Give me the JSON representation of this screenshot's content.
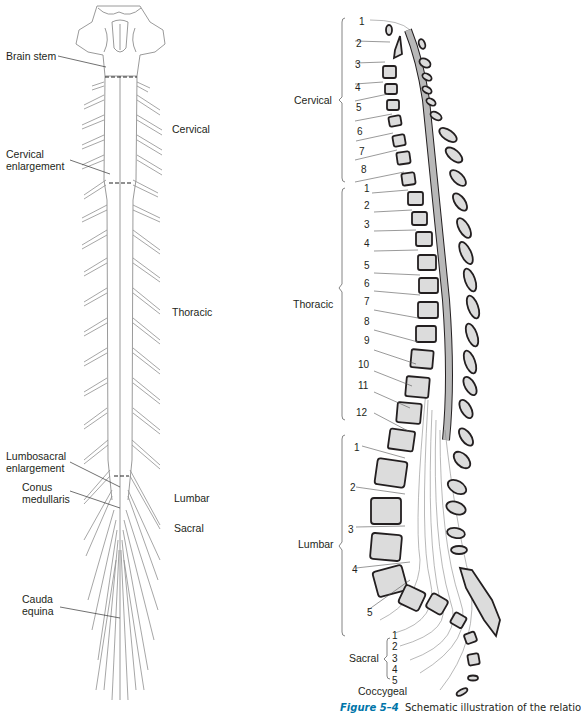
{
  "left_diagram": {
    "title": "Spinal cord (posterior view)",
    "labels": {
      "brain_stem": "Brain stem",
      "cervical_enlargement_1": "Cervical",
      "cervical_enlargement_2": "enlargement",
      "lumbosacral_enlargement_1": "Lumbosacral",
      "lumbosacral_enlargement_2": "enlargement",
      "conus_1": "Conus",
      "conus_2": "medullaris",
      "cauda_1": "Cauda",
      "cauda_2": "equina"
    },
    "regions": {
      "cervical": "Cervical",
      "thoracic": "Thoracic",
      "lumbar": "Lumbar",
      "sacral": "Sacral"
    }
  },
  "right_diagram": {
    "regions": {
      "cervical": "Cervical",
      "thoracic": "Thoracic",
      "lumbar": "Lumbar",
      "sacral": "Sacral",
      "coccygeal": "Coccygeal"
    },
    "cervical_numbers": [
      "1",
      "2",
      "3",
      "4",
      "5",
      "6",
      "7",
      "8"
    ],
    "thoracic_numbers": [
      "1",
      "2",
      "3",
      "4",
      "5",
      "6",
      "7",
      "8",
      "9",
      "10",
      "11",
      "12"
    ],
    "lumbar_numbers": [
      "1",
      "2",
      "3",
      "4",
      "5"
    ],
    "sacral_numbers": [
      "1",
      "2",
      "3",
      "4",
      "5"
    ]
  },
  "caption": {
    "figure_label": "Figure 5–4",
    "text": "Schematic illustration of the relatio"
  },
  "colors": {
    "bone_fill": "#dcdcdc",
    "cord_fill": "#b8b8b8",
    "line": "#231f20",
    "nerve": "#8a8a8a",
    "figure_label": "#0075a9"
  }
}
